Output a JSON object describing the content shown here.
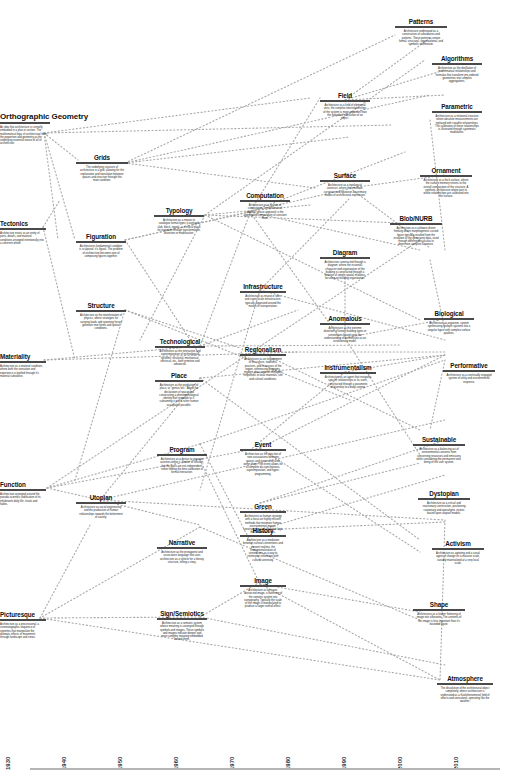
{
  "diagram": {
    "type": "timeline-network",
    "timeline": {
      "ticks": [
        "1930",
        "1940",
        "1950",
        "1960",
        "1970",
        "1980",
        "1990",
        "2000",
        "2010"
      ]
    },
    "nodes": [
      {
        "id": "orthographic-geometry",
        "title": "Orthographic Geometry",
        "desc": "An idea that architecture is centrally embodied in a plan or section. The mathematical logic of architectural form, the proportion and geometry as the underlying essential nature of all of architecture."
      },
      {
        "id": "grids",
        "title": "Grids",
        "desc": "The underlying structure of architecture is a grid, allowing for the explanation and translation between spaces and structure through this main condition."
      },
      {
        "id": "tectonics",
        "title": "Tectonics",
        "desc": "Architecture exists as an entity of parts, details, and material conditions arranged intentionally into a coherent whole."
      },
      {
        "id": "figuration",
        "title": "Figuration",
        "desc": "Architectures fundamental condition is sculptural: it's figural. The problem of architecture becomes one of composing figures together."
      },
      {
        "id": "typology",
        "title": "Typology",
        "desc": "Architecture as a means to catalogue formal types (courtyard, slab, block, tower) — a critical place for invention through transformation, distortion or modification."
      },
      {
        "id": "structure",
        "title": "Structure",
        "desc": "Architecture as the manifestation of physics, where strategies for carrying loads and spanning forces generate new forms and spatial conditions."
      },
      {
        "id": "materiality",
        "title": "Materiality",
        "desc": "Architecture as a material condition, where both the sensation and experience is typified through it's material substance."
      },
      {
        "id": "technological",
        "title": "Technological",
        "desc": "Architecture as the interaction and superimposition of technological systems: structural, mechanical, electrical, etc., both primitive and advanced."
      },
      {
        "id": "place",
        "title": "Place",
        "desc": "Architecture as the production of place, or \"genius loci.\" About the declaration of space and constructing a phenomenological identity that responds to it, subsuming it into a richer human occupation possible."
      },
      {
        "id": "program",
        "title": "Program",
        "desc": "Architecture as a device to organize activities within it. Similar to function, but the goals are not independent, rather finding the best calibration of formal interaction."
      },
      {
        "id": "function",
        "title": "Function",
        "desc": "Architecture arranged around the pseudo-scientific codification of its inhabitants daily life, rituals and habits."
      },
      {
        "id": "utopian",
        "title": "Utopian",
        "desc": "Architecture as social engineering and the production of human relationships towards the betterment of society."
      },
      {
        "id": "narrative",
        "title": "Narrative",
        "desc": "Architecture as the protagonist and associative language that uses architecture as a vehicle for a literary structure, telling a story."
      },
      {
        "id": "picturesque",
        "title": "Picturesque",
        "desc": "Architecture as a processional, a cinematographic sequence of vignettes that manipulate the dramatic effects of movement through landscape and views."
      },
      {
        "id": "sign-semiotics",
        "title": "Sign/Semiotics",
        "desc": "Architecture as a semiotic system whose meaning is conveyed through symbols and images. These symbols and images indicate deeper and more complex meaning embedded behind them."
      },
      {
        "id": "computation",
        "title": "Computation",
        "desc": "Architecture as a system of computation, a mathematical process whose approach is the aggregated computation of constant flows."
      },
      {
        "id": "infrastructure",
        "title": "Infrastructure",
        "desc": "Architecture as resource sites and super-scale infrastructure, typically organized around the means of transportation."
      },
      {
        "id": "regionalism",
        "title": "Regionalism",
        "desc": "Architecture as an engagement of the culture, traditions, practices, and resources of the region, referencing programs, modern ideas against intelligent responses to local materials, site and cultural conditions."
      },
      {
        "id": "event",
        "title": "Event",
        "desc": "Architecture as the injection of new associations between spaces and events that arise within them. The event allows for a complete dis-synchronous, superimposition, and hyper-programming."
      },
      {
        "id": "green",
        "title": "Green",
        "desc": "Architecture as human strategy with a focus on highly efficient methods that minimize human environmental impact, constructed out of a positive logic that connects values."
      },
      {
        "id": "history",
        "title": "History",
        "desc": "Architecture as a mediation between cultural conventions and present realities, the instrumentalization of conventions as a way to reinterpret innovation with cultural continuity."
      },
      {
        "id": "image",
        "title": "Image",
        "desc": "Architecture as an iconic abstracted image, a flattening of the semiotic system into iconography. Typically the scale of the image is manipulated to produce a larger overall effect."
      },
      {
        "id": "field",
        "title": "Field",
        "desc": "Architecture as a field of elemental units, the complex interrelationships of the system is more important than the individual interaction of an object."
      },
      {
        "id": "surface",
        "title": "Surface",
        "desc": "Architecture as a topological construct, where the envelope, curvature and figuration are primary modes of architectural expression."
      },
      {
        "id": "diagram",
        "title": "Diagram",
        "desc": "Architecture constructed through a diagram, where the essential character and organization of the building is constructed through a notation of simple spatial relations, focusing on building organization."
      },
      {
        "id": "anomalous",
        "title": "Anomalous",
        "desc": "Architecture as the extreme distortion of known building types or conventions based upon the understanding of architecture as an evolutionary model."
      },
      {
        "id": "instrumentalism",
        "title": "Instrumentalism",
        "desc": "Architecture as an agent that instigates specific relationships or its users, constructed through a parametric relationship to a body context."
      },
      {
        "id": "patterns",
        "title": "Patterns",
        "desc": "Architecture understood as a construction of subsidiaries and patterns. These patterns contain formal, structural, organizational, and symbolic information."
      },
      {
        "id": "algorithms",
        "title": "Algorithms",
        "desc": "Architecture as the distillation of mathematical relationships and formulas that transform pre-ordered geometries into complex aggregations."
      },
      {
        "id": "parametric",
        "title": "Parametric",
        "desc": "Architecture as a relational structure where absolute measurements are replaced with variable relationships. The calibration of these relationships is illustrated through systematic modulation."
      },
      {
        "id": "ornament",
        "title": "Ornament",
        "desc": "Architecture as a thick surface, where the surface memory returns to the overall composition of the structure. A synthetic architecture where part to whole relationships are calibrated into the surface."
      },
      {
        "id": "blob-nurb",
        "title": "Blob/NURB",
        "desc": "Architecture as a software driven thinking where morphogenetic curved figure typically resulted from the evolution of the generative data, used through differential calculus to determine complex curvature."
      },
      {
        "id": "biological",
        "title": "Biological",
        "desc": "Architecture as organism, system synthesizing multiple systems into a singular figure with complex surface qualities."
      },
      {
        "id": "performative",
        "title": "Performative",
        "desc": "Architecture as a continually engaged system of utility and environmental response."
      },
      {
        "id": "sustainable",
        "title": "Sustainable",
        "desc": "Architecture as a balancing act of environmental concerns from conserving resources and emissions while considering the permanent well-being of the user system."
      },
      {
        "id": "dystopian",
        "title": "Dystopian",
        "desc": "Architecture as a critical and reactionary construction, positioning cautionary and apocalyptic visions based upon utopian models."
      },
      {
        "id": "activism",
        "title": "Activism",
        "desc": "Architecture as agitating and a social agent of change on a massive scale, variably materialized at a very local scale."
      },
      {
        "id": "shape",
        "title": "Shape",
        "desc": "Architecture as a further flattening of image into silhouette. The contents of the image is less important than it's bounded figure."
      },
      {
        "id": "atmosphere",
        "title": "Atmosphere",
        "desc": "The dissolution of the architectural object completely, where architecture is understood as a fluid phenomenal field of effects and sensations, operating like the weather."
      }
    ]
  }
}
